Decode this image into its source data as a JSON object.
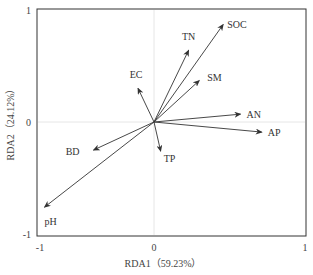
{
  "chart_data": {
    "type": "scatter",
    "subtype": "rda-biplot-vectors",
    "title": "",
    "xlabel": "RDA1（59.23%）",
    "ylabel": "RDA2（24.12%）",
    "xlim": [
      -1,
      1
    ],
    "ylim": [
      -1,
      1
    ],
    "xticks": [
      "-1",
      "0",
      "1"
    ],
    "yticks": [
      "-1",
      "0",
      "1"
    ],
    "grid": "zero-lines only (light gray)",
    "legend": null,
    "vectors": [
      {
        "name": "SOC",
        "x": 0.52,
        "y": 0.87
      },
      {
        "name": "TN",
        "x": 0.26,
        "y": 0.64
      },
      {
        "name": "SM",
        "x": 0.34,
        "y": 0.37
      },
      {
        "name": "EC",
        "x": -0.14,
        "y": 0.3
      },
      {
        "name": "AN",
        "x": 0.65,
        "y": 0.07
      },
      {
        "name": "AP",
        "x": 0.81,
        "y": -0.09
      },
      {
        "name": "TP",
        "x": 0.05,
        "y": -0.26
      },
      {
        "name": "BD",
        "x": -0.53,
        "y": -0.25
      },
      {
        "name": "pH",
        "x": -0.96,
        "y": -0.76
      }
    ]
  },
  "colors": {
    "arrow": "#333333",
    "frame": "#333333",
    "zero_line": "#e6e6e6",
    "background": "#ffffff"
  }
}
